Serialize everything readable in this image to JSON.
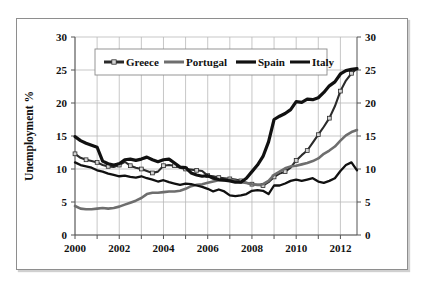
{
  "figure": {
    "background_color": "#ffffff",
    "frame_color": "#8e8e8e"
  },
  "chart_data": {
    "type": "line",
    "title": "",
    "xlabel": "",
    "ylabel": "Unemployment %",
    "xlim": [
      2000,
      2012.75
    ],
    "ylim": [
      0,
      30
    ],
    "grid": true,
    "legend_position": "top-center",
    "dual_y_axis": true,
    "xticks": [
      2000,
      2002,
      2004,
      2006,
      2008,
      2010,
      2012
    ],
    "xtick_labels": [
      "2000",
      "2002",
      "2004",
      "2006",
      "2008",
      "2010",
      "2012"
    ],
    "yticks": [
      0,
      5,
      10,
      15,
      20,
      25,
      30
    ],
    "ytick_labels": [
      "0",
      "5",
      "10",
      "15",
      "20",
      "25",
      "30"
    ],
    "ytick_labels_right": [
      "0",
      "5",
      "10",
      "15",
      "20",
      "25",
      "30"
    ],
    "x": [
      2000,
      2000.25,
      2000.5,
      2000.75,
      2001,
      2001.25,
      2001.5,
      2001.75,
      2002,
      2002.25,
      2002.5,
      2002.75,
      2003,
      2003.25,
      2003.5,
      2003.75,
      2004,
      2004.25,
      2004.5,
      2004.75,
      2005,
      2005.25,
      2005.5,
      2005.75,
      2006,
      2006.25,
      2006.5,
      2006.75,
      2007,
      2007.25,
      2007.5,
      2007.75,
      2008,
      2008.25,
      2008.5,
      2008.75,
      2009,
      2009.25,
      2009.5,
      2009.75,
      2010,
      2010.25,
      2010.5,
      2010.75,
      2011,
      2011.25,
      2011.5,
      2011.75,
      2012,
      2012.25,
      2012.5,
      2012.75
    ],
    "series": [
      {
        "name": "Greece",
        "color": "#2b2b2b",
        "style": "line-with-square-markers",
        "marker": "square",
        "marker_fill": "#d5d5d5",
        "line_width": 2.1,
        "values": [
          12.3,
          11.7,
          11.4,
          11.2,
          11.0,
          10.6,
          10.4,
          10.3,
          10.6,
          11.1,
          10.5,
          10.2,
          10.0,
          9.7,
          9.4,
          9.6,
          10.5,
          10.6,
          10.5,
          10.2,
          10.0,
          9.9,
          9.8,
          9.7,
          9.0,
          8.9,
          8.7,
          8.6,
          8.5,
          8.4,
          8.2,
          7.9,
          7.7,
          7.6,
          7.5,
          8.0,
          8.8,
          9.3,
          9.6,
          10.2,
          11.3,
          12.1,
          12.8,
          14.0,
          15.2,
          16.4,
          17.7,
          19.5,
          21.8,
          23.4,
          24.5,
          25.2
        ]
      },
      {
        "name": "Portugal",
        "color": "#6e6e6e",
        "style": "line",
        "marker": "none",
        "line_width": 2.6,
        "values": [
          4.4,
          4.0,
          3.9,
          3.9,
          4.0,
          4.1,
          4.0,
          4.1,
          4.3,
          4.6,
          4.9,
          5.2,
          5.6,
          6.2,
          6.4,
          6.4,
          6.5,
          6.6,
          6.6,
          6.7,
          7.0,
          7.4,
          7.6,
          7.7,
          7.9,
          8.1,
          8.3,
          8.3,
          8.4,
          8.2,
          8.0,
          7.9,
          7.7,
          7.6,
          7.7,
          8.2,
          9.1,
          9.6,
          10.1,
          10.4,
          10.5,
          10.7,
          10.9,
          11.2,
          11.6,
          12.3,
          12.8,
          13.4,
          14.3,
          15.1,
          15.6,
          15.9
        ]
      },
      {
        "name": "Spain",
        "color": "#111111",
        "style": "line",
        "marker": "none",
        "line_width": 3.2,
        "values": [
          14.9,
          14.3,
          13.9,
          13.6,
          13.3,
          11.2,
          10.8,
          10.6,
          10.8,
          11.4,
          11.5,
          11.3,
          11.5,
          11.8,
          11.4,
          11.1,
          11.4,
          11.5,
          10.9,
          10.3,
          10.2,
          9.4,
          9.1,
          8.9,
          9.0,
          8.6,
          8.4,
          8.3,
          8.2,
          8.0,
          8.0,
          8.6,
          9.6,
          10.6,
          11.9,
          14.1,
          17.5,
          18.0,
          18.4,
          19.0,
          20.2,
          20.1,
          20.6,
          20.5,
          20.8,
          21.6,
          22.6,
          23.2,
          24.4,
          24.9,
          25.1,
          25.2
        ]
      },
      {
        "name": "Italy",
        "color": "#111111",
        "style": "line",
        "marker": "none",
        "line_width": 2.3,
        "values": [
          11.0,
          10.6,
          10.4,
          10.2,
          9.8,
          9.6,
          9.3,
          9.1,
          8.9,
          9.0,
          8.8,
          8.7,
          8.9,
          8.6,
          8.4,
          8.1,
          8.3,
          8.0,
          7.8,
          7.6,
          7.8,
          7.7,
          7.5,
          7.3,
          7.0,
          6.6,
          6.9,
          6.6,
          6.0,
          5.9,
          6.0,
          6.2,
          6.7,
          6.8,
          6.7,
          6.2,
          7.5,
          7.5,
          7.8,
          8.2,
          8.4,
          8.2,
          8.4,
          8.6,
          8.1,
          7.9,
          8.2,
          8.6,
          9.7,
          10.6,
          11.0,
          9.8
        ]
      }
    ]
  },
  "legend": {
    "entries": [
      {
        "label": "Greece"
      },
      {
        "label": "Portugal"
      },
      {
        "label": "Spain"
      },
      {
        "label": "Italy"
      }
    ]
  }
}
